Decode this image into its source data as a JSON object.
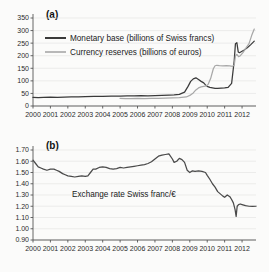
{
  "figure": {
    "background": "#fbfbfa",
    "panels": [
      {
        "key": "a",
        "label": "(a)"
      },
      {
        "key": "b",
        "label": "(b)"
      }
    ]
  },
  "colors": {
    "monetary_base": "#3a3a3a",
    "currency_reserves": "#a8a8a8",
    "exchange_rate": "#4a4a4a",
    "axis": "#555555",
    "grid": "#e3e3e0",
    "text": "#1a1a1a"
  },
  "chart_data": [
    {
      "type": "line",
      "panel": "(a)",
      "title": "",
      "xlabel": "",
      "ylabel": "",
      "xlim": [
        2000,
        2012.8
      ],
      "ylim": [
        0,
        350
      ],
      "yticks": [
        0,
        50,
        100,
        150,
        200,
        250,
        300,
        350
      ],
      "ytick_labels": [
        "0",
        "50",
        "100",
        "150",
        "200",
        "250",
        "300",
        "350"
      ],
      "xticks": [
        2000,
        2001,
        2002,
        2003,
        2004,
        2005,
        2006,
        2007,
        2008,
        2009,
        2010,
        2011,
        2012
      ],
      "xtick_labels": [
        "2000",
        "2001",
        "2002",
        "2003",
        "2004",
        "2005",
        "2006",
        "2007",
        "2008",
        "2009",
        "2010",
        "2011",
        "2012"
      ],
      "grid": true,
      "legend_position": "upper-left",
      "series": [
        {
          "name": "Monetary base (billions of Swiss francs)",
          "color": "#3a3a3a",
          "x": [
            2000.0,
            2000.3,
            2000.6,
            2001.0,
            2001.4,
            2001.8,
            2002.2,
            2002.6,
            2003.0,
            2003.5,
            2004.0,
            2004.5,
            2005.0,
            2005.4,
            2005.8,
            2006.2,
            2006.6,
            2007.0,
            2007.4,
            2007.8,
            2008.1,
            2008.4,
            2008.7,
            2008.9,
            2009.05,
            2009.2,
            2009.35,
            2009.5,
            2009.65,
            2009.8,
            2009.9,
            2010.0,
            2010.15,
            2010.3,
            2010.45,
            2010.6,
            2010.8,
            2011.0,
            2011.2,
            2011.4,
            2011.55,
            2011.62,
            2011.7,
            2011.78,
            2011.85,
            2011.95,
            2012.1,
            2012.3,
            2012.5,
            2012.7
          ],
          "y": [
            34,
            33,
            34,
            35,
            34,
            35,
            36,
            36,
            37,
            38,
            38,
            39,
            39,
            40,
            40,
            41,
            40,
            41,
            42,
            43,
            44,
            46,
            55,
            78,
            98,
            108,
            112,
            105,
            98,
            92,
            84,
            78,
            74,
            72,
            70,
            70,
            71,
            72,
            74,
            90,
            180,
            248,
            252,
            215,
            212,
            216,
            222,
            232,
            244,
            258
          ]
        },
        {
          "name": "Currency reserves (billions of euros)",
          "color": "#a8a8a8",
          "x": [
            2005.0,
            2005.3,
            2005.6,
            2006.0,
            2006.4,
            2006.8,
            2007.2,
            2007.6,
            2008.0,
            2008.4,
            2008.8,
            2009.0,
            2009.2,
            2009.35,
            2009.5,
            2009.65,
            2009.8,
            2009.95,
            2010.05,
            2010.2,
            2010.35,
            2010.45,
            2010.55,
            2010.7,
            2010.9,
            2011.1,
            2011.3,
            2011.45,
            2011.55,
            2011.62,
            2011.7,
            2011.8,
            2011.9,
            2012.05,
            2012.2,
            2012.4,
            2012.55,
            2012.7
          ],
          "y": [
            30,
            29,
            29,
            30,
            29,
            30,
            30,
            31,
            32,
            33,
            36,
            42,
            52,
            64,
            72,
            76,
            78,
            80,
            86,
            110,
            148,
            160,
            162,
            161,
            160,
            161,
            160,
            158,
            162,
            200,
            205,
            196,
            200,
            212,
            228,
            248,
            280,
            306
          ]
        }
      ]
    },
    {
      "type": "line",
      "panel": "(b)",
      "title": "",
      "xlabel": "",
      "ylabel": "",
      "annotation": "Exchange rate Swiss franc/€",
      "xlim": [
        2000,
        2012.8
      ],
      "ylim": [
        0.9,
        1.7
      ],
      "yticks": [
        0.9,
        1.0,
        1.1,
        1.2,
        1.3,
        1.4,
        1.5,
        1.6,
        1.7
      ],
      "ytick_labels": [
        "0.90",
        "1.00",
        "1.10",
        "1.20",
        "1.30",
        "1.40",
        "1.50",
        "1.60",
        "1.70"
      ],
      "xticks": [
        2000,
        2001,
        2002,
        2003,
        2004,
        2005,
        2006,
        2007,
        2008,
        2009,
        2010,
        2011,
        2012
      ],
      "xtick_labels": [
        "2000",
        "2001",
        "2002",
        "2003",
        "2004",
        "2005",
        "2006",
        "2007",
        "2008",
        "2009",
        "2010",
        "2011",
        "2012"
      ],
      "grid": true,
      "series": [
        {
          "name": "Exchange rate Swiss franc/€",
          "color": "#4a4a4a",
          "x": [
            2000.0,
            2000.15,
            2000.3,
            2000.45,
            2000.6,
            2000.8,
            2001.0,
            2001.2,
            2001.35,
            2001.5,
            2001.7,
            2001.85,
            2002.0,
            2002.2,
            2002.4,
            2002.6,
            2002.8,
            2003.0,
            2003.15,
            2003.3,
            2003.45,
            2003.6,
            2003.8,
            2004.0,
            2004.2,
            2004.4,
            2004.6,
            2004.8,
            2005.0,
            2005.2,
            2005.4,
            2005.6,
            2005.8,
            2006.0,
            2006.2,
            2006.4,
            2006.6,
            2006.8,
            2007.0,
            2007.2,
            2007.4,
            2007.6,
            2007.8,
            2008.0,
            2008.1,
            2008.25,
            2008.4,
            2008.55,
            2008.7,
            2008.85,
            2009.0,
            2009.15,
            2009.3,
            2009.5,
            2009.7,
            2009.9,
            2010.0,
            2010.15,
            2010.3,
            2010.45,
            2010.6,
            2010.75,
            2010.9,
            2011.0,
            2011.15,
            2011.3,
            2011.4,
            2011.5,
            2011.6,
            2011.66,
            2011.72,
            2011.8,
            2011.9,
            2012.0,
            2012.2,
            2012.4,
            2012.6,
            2012.8
          ],
          "y": [
            1.61,
            1.58,
            1.55,
            1.54,
            1.53,
            1.52,
            1.53,
            1.53,
            1.52,
            1.51,
            1.49,
            1.48,
            1.47,
            1.465,
            1.46,
            1.465,
            1.47,
            1.465,
            1.47,
            1.5,
            1.53,
            1.53,
            1.545,
            1.55,
            1.545,
            1.535,
            1.53,
            1.535,
            1.545,
            1.54,
            1.545,
            1.55,
            1.555,
            1.56,
            1.565,
            1.57,
            1.58,
            1.595,
            1.62,
            1.645,
            1.655,
            1.66,
            1.665,
            1.62,
            1.59,
            1.6,
            1.625,
            1.615,
            1.59,
            1.52,
            1.5,
            1.515,
            1.51,
            1.515,
            1.51,
            1.5,
            1.475,
            1.44,
            1.4,
            1.37,
            1.33,
            1.31,
            1.29,
            1.28,
            1.3,
            1.285,
            1.26,
            1.23,
            1.17,
            1.11,
            1.2,
            1.215,
            1.22,
            1.215,
            1.205,
            1.2,
            1.198,
            1.2
          ]
        }
      ]
    }
  ]
}
